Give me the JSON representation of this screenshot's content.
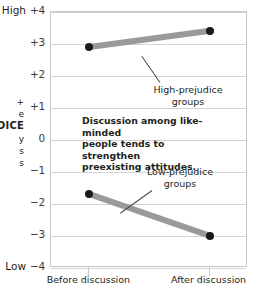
{
  "chart_data": {
    "type": "line",
    "title": "",
    "xlabel": "",
    "ylabel": "ATTITUDE / PREJUDICE",
    "x": [
      "Before discussion",
      "After discussion"
    ],
    "categories": [
      "Before discussion",
      "After discussion"
    ],
    "series": [
      {
        "name": "High-prejudice groups",
        "values": [
          2.9,
          3.4
        ]
      },
      {
        "name": "Low-prejudice groups",
        "values": [
          -1.7,
          -3.0
        ]
      }
    ],
    "ylim": [
      -4,
      4
    ],
    "yticks": [
      "+4",
      "+3",
      "+2",
      "+1",
      "0",
      "-1",
      "-2",
      "-3",
      "-4"
    ],
    "ytick_values": [
      4,
      3,
      2,
      1,
      0,
      -1,
      -2,
      -3,
      -4
    ],
    "y_high_label": "High",
    "y_low_label": "Low",
    "grid": true,
    "legend": "inline-callouts",
    "annotations": [
      "Discussion among like-minded people tends to strengthen preexisting attitudes."
    ],
    "colors": {
      "band": "#9a9a9a",
      "dot": "#1a1a1a",
      "grid": "#d4d4d4",
      "frame": "#c8c8c8",
      "text": "#231f20"
    }
  },
  "axis": {
    "y_title_line1": "+",
    "y_title_line2": "e",
    "y_title_strong": "JUDICE",
    "y_title_line4": "y",
    "y_title_line5": "s",
    "y_title_line6": "s",
    "high_label": "High",
    "low_label": "Low",
    "ticks": [
      {
        "label": "+4",
        "value": 4
      },
      {
        "label": "+3",
        "value": 3
      },
      {
        "label": "+2",
        "value": 2
      },
      {
        "label": "+1",
        "value": 1
      },
      {
        "label": "0",
        "value": 0
      },
      {
        "label": "−1",
        "value": -1
      },
      {
        "label": "−2",
        "value": -2
      },
      {
        "label": "−3",
        "value": -3
      },
      {
        "label": "−4",
        "value": -4
      }
    ],
    "x_labels": [
      {
        "label": "Before discussion"
      },
      {
        "label": "After discussion"
      }
    ]
  },
  "callouts": {
    "high": {
      "line1": "High-prejudice",
      "line2": "groups"
    },
    "low": {
      "line1": "Low-prejudice",
      "line2": "groups"
    }
  },
  "annotation": {
    "line1": "Discussion among like-minded",
    "line2": "people tends to strengthen",
    "line3": "preexisting attitudes."
  }
}
